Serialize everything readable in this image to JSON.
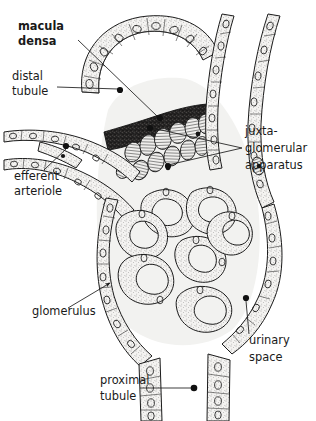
{
  "figure": {
    "background_color": "#ffffff",
    "ink_color": "#1a1a1a",
    "width": 316,
    "height": 421
  },
  "labels": [
    {
      "id": "macula-densa",
      "lines": [
        "macula",
        "densa"
      ],
      "line1": "macula",
      "line2": "densa",
      "bold": true,
      "x": 18,
      "y": 30,
      "pointer": "line-dot",
      "dot_x": 160,
      "dot_y": 118
    },
    {
      "id": "distal-tubule",
      "lines": [
        "distal",
        "tubule"
      ],
      "line1": "distal",
      "line2": "tubule",
      "bold": false,
      "x": 12,
      "y": 80,
      "pointer": "line-dot",
      "dot_x": 120,
      "dot_y": 90
    },
    {
      "id": "efferent-arteriole",
      "lines": [
        "efferent",
        "arteriole"
      ],
      "line1": "efferent",
      "line2": "arteriole",
      "bold": false,
      "x": 14,
      "y": 180,
      "pointer": "line-dot",
      "dot_x": 66,
      "dot_y": 146
    },
    {
      "id": "juxtaglomerular-apparatus",
      "lines": [
        "juxta-",
        "glomerular",
        "apparatus"
      ],
      "line1": "juxta-",
      "line2": "glomerular",
      "line3": "apparatus",
      "bold": false,
      "x": 245,
      "y": 135,
      "pointer": "forked-two-dots",
      "dot1_x": 150,
      "dot1_y": 128,
      "dot2_x": 166,
      "dot2_y": 165
    },
    {
      "id": "glomerulus",
      "lines": [
        "glomerulus"
      ],
      "line1": "glomerulus",
      "bold": false,
      "x": 32,
      "y": 315,
      "pointer": "arrow",
      "tip_x": 113,
      "tip_y": 280
    },
    {
      "id": "urinary-space",
      "lines": [
        "urinary",
        "space"
      ],
      "line1": "urinary",
      "line2": "space",
      "bold": false,
      "x": 249,
      "y": 344,
      "pointer": "line-dot",
      "dot_x": 246,
      "dot_y": 298
    },
    {
      "id": "proximal-tubule",
      "lines": [
        "proximal",
        "tubule"
      ],
      "line1": "proximal",
      "line2": "tubule",
      "bold": false,
      "x": 100,
      "y": 384,
      "pointer": "line-dot",
      "dot_x": 194,
      "dot_y": 388
    }
  ],
  "structures": [
    {
      "id": "distal-tubule-arc",
      "name": "distal tubule epithelium"
    },
    {
      "id": "macula-densa-band",
      "name": "macula densa cells"
    },
    {
      "id": "jg-cells",
      "name": "juxtaglomerular granular cells"
    },
    {
      "id": "afferent-arteriole",
      "name": "afferent arteriole"
    },
    {
      "id": "efferent-arteriole-vessel",
      "name": "efferent arteriole"
    },
    {
      "id": "glomerular-tuft",
      "name": "glomerular capillary tuft"
    },
    {
      "id": "bowmans-capsule",
      "name": "Bowman's capsule"
    },
    {
      "id": "urinary-space-region",
      "name": "urinary space"
    },
    {
      "id": "proximal-tubule-wall",
      "name": "proximal tubule"
    }
  ]
}
